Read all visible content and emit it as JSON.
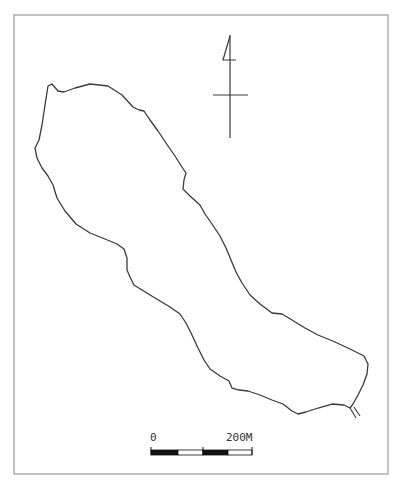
{
  "map": {
    "type": "lake-outline",
    "frame": {
      "x": 14,
      "y": 15,
      "width": 374,
      "height": 459,
      "stroke": "#9a9a9a"
    },
    "outline_color": "#3a3a3a",
    "lake_outline": "M48,86 L52,84 L58,91 L64,92 L75,88 L90,84 L108,86 L122,95 L133,107 L139,110 L144,111 L150,120 L158,131 L166,143 L175,156 L182,167 L186,173 L184,180 L183,189 L190,196 L200,205 L205,214 L212,224 L220,236 L226,248 L231,260 L236,272 L242,283 L250,295 L260,304 L272,313 L282,314 L292,320 L305,328 L318,335 L335,342 L350,349 L364,356 L368,364 L367,374 L363,385 L358,395 L353,404 L350,408 L344,405 L332,404 L318,408 L306,412 L298,414 L292,411 L283,404 L272,400 L260,395 L248,391 L239,390 L232,388 L229,381 L220,376 L210,369 L204,360 L198,348 L192,335 L186,323 L180,314 L170,307 L155,298 L142,290 L134,285 L130,277 L127,270 L127,258 L124,249 L117,244 L105,239 L90,233 L76,224 L65,211 L57,198 L53,185 L48,176 L42,168 L37,158 L35,148 L39,140 L42,125 L45,105 Z",
    "outlet": {
      "line1": "M350,408 L356,418",
      "line2": "M354,407 L360,416"
    },
    "north_arrow": {
      "shaft": {
        "x": 230,
        "y1": 35,
        "y2": 138
      },
      "head": "M230,36 L223,60 L236,60",
      "crossbar": {
        "x1": 213,
        "x2": 248,
        "y": 95
      }
    },
    "scale_bar": {
      "x": 151,
      "y": 450,
      "width": 101,
      "height": 5,
      "segments": [
        {
          "x": 151,
          "w": 27,
          "fill": "#111111"
        },
        {
          "x": 178,
          "w": 25,
          "fill": "#ffffff"
        },
        {
          "x": 203,
          "w": 25,
          "fill": "#111111"
        },
        {
          "x": 228,
          "w": 24,
          "fill": "#ffffff"
        }
      ],
      "ticks_x": [
        151,
        203,
        252
      ],
      "label_start": "0",
      "label_end": "200M",
      "label_start_x": 150,
      "label_end_x": 226,
      "label_y": 441
    }
  }
}
